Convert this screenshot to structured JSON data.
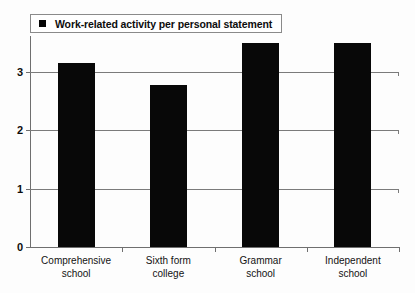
{
  "legend": {
    "marker": "filled-square",
    "label": "Work-related activity per personal statement"
  },
  "axis": {
    "y_ticks": [
      "0",
      "1",
      "2",
      "3"
    ]
  },
  "chart_data": {
    "type": "bar",
    "title": "",
    "subtitle": "",
    "xlabel": "",
    "ylabel": "",
    "categories": [
      "Comprehensive\nschool",
      "Sixth form\ncollege",
      "Grammar\nschool",
      "Independent\nschool"
    ],
    "series": [
      {
        "name": "Work-related activity per personal statement",
        "values": [
          3.15,
          2.78,
          3.5,
          3.5
        ],
        "color": "#080808"
      }
    ],
    "ylim": [
      0,
      3.62
    ],
    "yticks": [
      0,
      1,
      2,
      3
    ],
    "grid": true,
    "legend_position": "top-left",
    "bar_color": "#080808",
    "gridline_color": "#7b7b7b",
    "axis_color": "#6f6f6f"
  }
}
